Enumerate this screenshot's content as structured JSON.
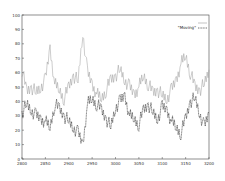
{
  "chart_data": {
    "type": "line",
    "title": "",
    "xlabel": "",
    "ylabel": "",
    "xlim": [
      2800,
      3200
    ],
    "ylim": [
      0,
      100
    ],
    "grid": false,
    "legend_position": "top-right",
    "x_ticks": [
      2800,
      2850,
      2900,
      2950,
      3000,
      3050,
      3100,
      3150,
      3200
    ],
    "y_ticks": [
      0,
      10,
      20,
      30,
      40,
      50,
      60,
      70,
      80,
      90,
      100
    ],
    "x": [
      2800,
      2810,
      2820,
      2830,
      2840,
      2850,
      2860,
      2870,
      2880,
      2890,
      2900,
      2910,
      2920,
      2930,
      2940,
      2950,
      2960,
      2970,
      2980,
      2990,
      3000,
      3010,
      3020,
      3030,
      3040,
      3050,
      3060,
      3070,
      3080,
      3090,
      3100,
      3110,
      3120,
      3130,
      3140,
      3150,
      3160,
      3170,
      3180,
      3190,
      3200
    ],
    "series": [
      {
        "name": "",
        "color": "#9a9a9a",
        "style": "solid",
        "values": [
          62,
          47,
          50,
          46,
          50,
          55,
          77,
          52,
          48,
          42,
          50,
          58,
          54,
          88,
          60,
          52,
          45,
          42,
          48,
          55,
          58,
          62,
          55,
          50,
          45,
          50,
          58,
          52,
          46,
          48,
          44,
          42,
          48,
          55,
          66,
          72,
          60,
          50,
          48,
          52,
          62
        ]
      },
      {
        "name": "\"Moving\"",
        "color": "#111111",
        "style": "dashed",
        "values": [
          32,
          38,
          34,
          30,
          28,
          26,
          22,
          38,
          35,
          30,
          26,
          22,
          18,
          10,
          38,
          42,
          38,
          34,
          28,
          22,
          36,
          40,
          44,
          30,
          28,
          24,
          34,
          38,
          32,
          28,
          36,
          34,
          26,
          22,
          18,
          28,
          40,
          42,
          32,
          22,
          32
        ]
      }
    ]
  },
  "legend": {
    "series1_label": "",
    "series2_label": "\"Moving\""
  }
}
